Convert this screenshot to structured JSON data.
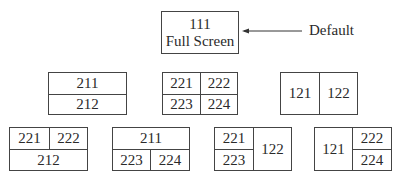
{
  "default_layout": {
    "line1": "111",
    "line2": "Full Screen"
  },
  "annotation": {
    "label": "Default"
  },
  "row2": {
    "a": {
      "top": "211",
      "bottom": "212"
    },
    "b": {
      "tl": "221",
      "tr": "222",
      "bl": "223",
      "br": "224"
    },
    "c": {
      "left": "121",
      "right": "122"
    }
  },
  "row3": {
    "d": {
      "tl": "221",
      "tr": "222",
      "bottom": "212"
    },
    "e": {
      "top": "211",
      "bl": "223",
      "br": "224"
    },
    "f": {
      "tl": "221",
      "bl": "223",
      "right": "122"
    },
    "g": {
      "left": "121",
      "tr": "222",
      "br": "224"
    }
  }
}
